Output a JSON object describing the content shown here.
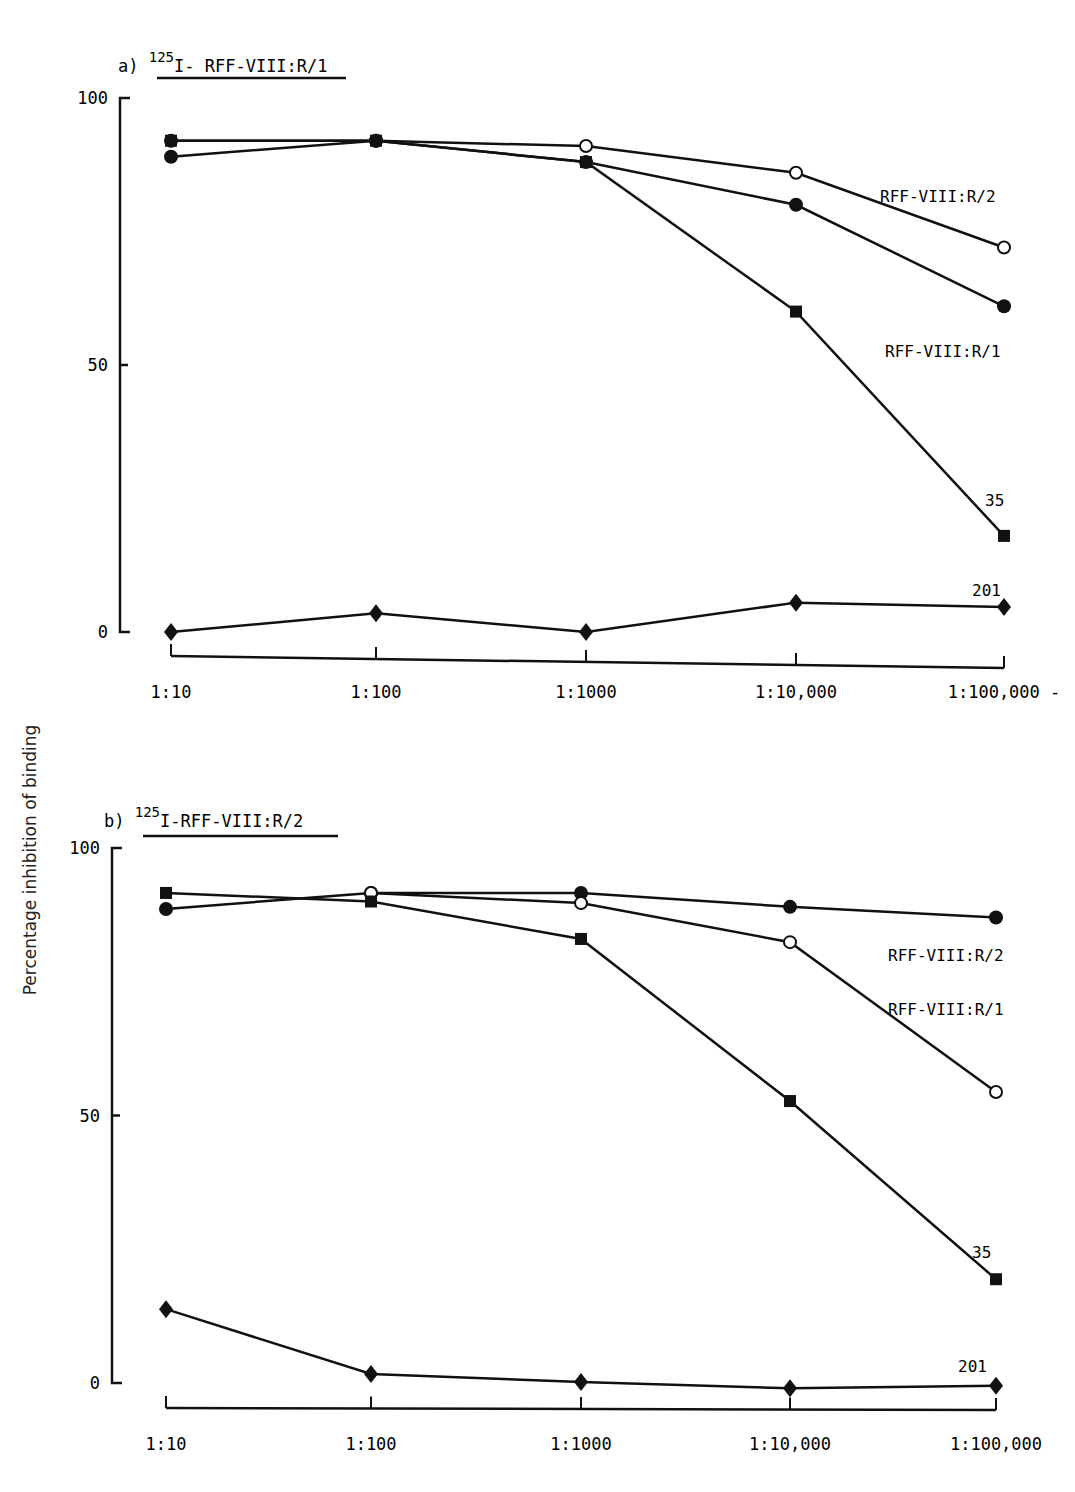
{
  "figure": {
    "ylabel": "Percentage inhibition of binding"
  },
  "chart_data": [
    {
      "type": "line",
      "panel": "a)",
      "title_sup": "125",
      "title": "I- RFF-VIII:R/1",
      "xlabel": "",
      "ylabel": "Percentage inhibition of binding",
      "categories": [
        "1:10",
        "1:100",
        "1:1000",
        "1:10,000",
        "1:100,000"
      ],
      "x_last_suffix": "-",
      "yticks": [
        0,
        50,
        100
      ],
      "ylim": [
        0,
        100
      ],
      "grid": false,
      "series": [
        {
          "name": "RFF-VIII:R/2",
          "marker": "open-circle",
          "values": [
            92,
            92,
            91,
            86,
            72
          ]
        },
        {
          "name": "RFF-VIII:R/1",
          "marker": "filled-circle",
          "values": [
            89,
            92,
            88,
            80,
            61
          ]
        },
        {
          "name": "35",
          "marker": "filled-square",
          "values": [
            92,
            92,
            88,
            60,
            18
          ]
        },
        {
          "name": "201",
          "marker": "filled-diamond",
          "values": [
            0,
            3.5,
            0,
            5.5,
            4.7
          ]
        }
      ]
    },
    {
      "type": "line",
      "panel": "b)",
      "title_sup": "125",
      "title": "I-RFF-VIII:R/2",
      "xlabel": "",
      "ylabel": "Percentage inhibition of binding",
      "categories": [
        "1:10",
        "1:100",
        "1:1000",
        "1:10,000",
        "1:100,000"
      ],
      "yticks": [
        0,
        50,
        100
      ],
      "ylim": [
        0,
        100
      ],
      "grid": false,
      "series": [
        {
          "name": "RFF-VIII:R/2",
          "marker": "filled-circle",
          "values": [
            88.6,
            91.6,
            91.6,
            89,
            87
          ]
        },
        {
          "name": "RFF-VIII:R/1",
          "marker": "open-circle",
          "values": [
            null,
            91.6,
            89.7,
            82.4,
            54.4
          ]
        },
        {
          "name": "35",
          "marker": "filled-square",
          "values": [
            91.6,
            90,
            83,
            52.7,
            19.4
          ]
        },
        {
          "name": "201",
          "marker": "filled-diamond",
          "values": [
            13.8,
            1.7,
            0.2,
            -1,
            -0.5
          ]
        }
      ]
    }
  ]
}
